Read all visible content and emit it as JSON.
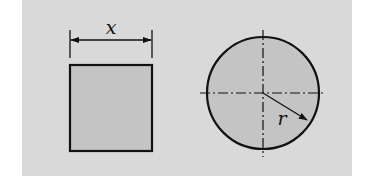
{
  "figure": {
    "colors": {
      "background": "#d9d9d9",
      "shape_fill": "#c4c4c4",
      "stroke": "#111111"
    },
    "square": {
      "dimension_label": "x"
    },
    "circle": {
      "radius_label": "r"
    }
  }
}
